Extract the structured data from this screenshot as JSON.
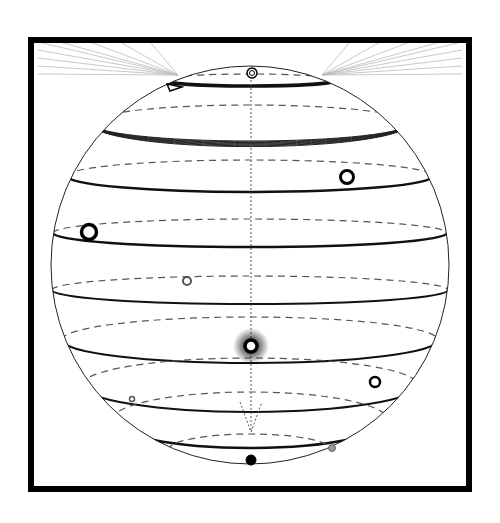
{
  "diagram": {
    "title": "",
    "canvas": {
      "width": 500,
      "height": 523,
      "background": "#ffffff"
    },
    "frame": {
      "x": 31,
      "y": 40,
      "width": 438,
      "height": 449,
      "stroke": "#000000",
      "stroke_width": 6
    },
    "sphere": {
      "cx": 250,
      "cy": 265,
      "r": 199,
      "stroke": "#222222",
      "stroke_width": 1
    },
    "axis": {
      "x": 251,
      "y1": 72,
      "y2": 432,
      "stroke": "#555555",
      "dash": "2,2"
    },
    "rays": {
      "color": "#bbbbbb",
      "left_origin": [
        178,
        75
      ],
      "right_origin": [
        322,
        75
      ],
      "left_targets": [
        [
          38,
          42
        ],
        [
          38,
          50
        ],
        [
          38,
          58
        ],
        [
          38,
          66
        ],
        [
          38,
          74
        ],
        [
          60,
          42
        ],
        [
          90,
          42
        ],
        [
          120,
          42
        ],
        [
          150,
          42
        ]
      ],
      "right_targets": [
        [
          462,
          42
        ],
        [
          462,
          50
        ],
        [
          462,
          58
        ],
        [
          462,
          66
        ],
        [
          462,
          74
        ],
        [
          440,
          42
        ],
        [
          410,
          42
        ],
        [
          380,
          42
        ],
        [
          350,
          42
        ]
      ]
    },
    "latitudes": [
      {
        "name": "lat-1",
        "y": 80,
        "rx": 88,
        "ry": 6,
        "solid_width": 3.5
      },
      {
        "name": "lat-2",
        "y": 123,
        "rx": 160,
        "ry": 18,
        "solid_width": 5,
        "bundle": true
      },
      {
        "name": "lat-3",
        "y": 176,
        "rx": 183,
        "ry": 16,
        "solid_width": 2.5
      },
      {
        "name": "lat-4",
        "y": 233,
        "rx": 197,
        "ry": 14,
        "solid_width": 2.5
      },
      {
        "name": "lat-5",
        "y": 290,
        "rx": 198,
        "ry": 14,
        "solid_width": 2
      },
      {
        "name": "lat-6",
        "y": 340,
        "rx": 188,
        "ry": 23,
        "solid_width": 2
      },
      {
        "name": "lat-7",
        "y": 385,
        "rx": 168,
        "ry": 27,
        "solid_width": 2
      },
      {
        "name": "lat-8",
        "y": 420,
        "rx": 138,
        "ry": 28,
        "solid_width": 2.5
      },
      {
        "name": "lat-9",
        "y": 450,
        "rx": 82,
        "ry": 16,
        "solid_width": 2
      }
    ],
    "markers": [
      {
        "name": "north-pole-marker",
        "cx": 252,
        "cy": 73,
        "r": 5,
        "fill": "#ffffff",
        "stroke": "#000000",
        "stroke_width": 1.5,
        "double": true
      },
      {
        "name": "orbit-point-1",
        "cx": 347,
        "cy": 177,
        "r": 6.5,
        "fill": "#ffffff",
        "stroke": "#000000",
        "stroke_width": 3
      },
      {
        "name": "orbit-point-2",
        "cx": 89,
        "cy": 232,
        "r": 7.5,
        "fill": "#ffffff",
        "stroke": "#000000",
        "stroke_width": 3.5
      },
      {
        "name": "orbit-point-3",
        "cx": 187,
        "cy": 281,
        "r": 4,
        "fill": "#ffffff",
        "stroke": "#555555",
        "stroke_width": 2
      },
      {
        "name": "center-highlight",
        "cx": 251,
        "cy": 346,
        "r": 6,
        "fill": "#ffffff",
        "stroke": "#000000",
        "stroke_width": 3.5,
        "glow": true
      },
      {
        "name": "orbit-point-4",
        "cx": 375,
        "cy": 382,
        "r": 5,
        "fill": "#ffffff",
        "stroke": "#000000",
        "stroke_width": 2.5
      },
      {
        "name": "orbit-point-5",
        "cx": 132,
        "cy": 399,
        "r": 2.5,
        "fill": "#ffffff",
        "stroke": "#555555",
        "stroke_width": 1.5
      },
      {
        "name": "south-pole-marker",
        "cx": 251,
        "cy": 460,
        "r": 5,
        "fill": "#000000",
        "stroke": "#000000",
        "stroke_width": 1
      },
      {
        "name": "gray-point",
        "cx": 332,
        "cy": 448,
        "r": 3.5,
        "fill": "#999999",
        "stroke": "#666666",
        "stroke_width": 1
      }
    ],
    "arrow": {
      "name": "direction-arrow",
      "points": "167,84 182,87 170,91",
      "stroke": "#000000"
    },
    "south_cone": {
      "apex": [
        251,
        432
      ],
      "left": [
        240,
        402
      ],
      "right": [
        262,
        402
      ]
    }
  }
}
